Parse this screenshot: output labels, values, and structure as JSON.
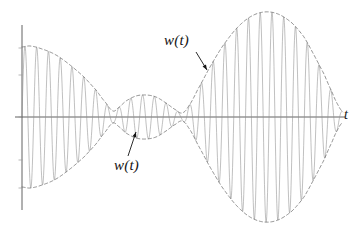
{
  "figure": {
    "title": "",
    "background_color": "#ffffff",
    "width": 358,
    "height": 236
  },
  "axes": {
    "t_axis": {
      "label": "t",
      "color": "#3a3a3a",
      "x_start": 15,
      "x_end": 345,
      "y": 117
    },
    "v_axis": {
      "label": "",
      "color": "#3a3a3a",
      "x": 22,
      "y_top": 25,
      "y_bottom": 210,
      "ticks": [
        48,
        75,
        117,
        160,
        188
      ]
    }
  },
  "annotations": [
    {
      "name": "envelope-label-upper",
      "text": "w(t)",
      "x": 164,
      "y": 33,
      "arrow": {
        "from_x": 196,
        "from_y": 52,
        "to_x": 207,
        "to_y": 70
      }
    },
    {
      "name": "envelope-label-lower",
      "text": "w(t)",
      "x": 114,
      "y": 158,
      "arrow": {
        "from_x": 128,
        "from_y": 156,
        "to_x": 136,
        "to_y": 132
      }
    }
  ],
  "chart_data": {
    "type": "line",
    "title": "",
    "xlabel": "t",
    "ylabel": "",
    "grid": false,
    "legend": null,
    "series": [
      {
        "name": "modulated-carrier",
        "style": "solid",
        "color": "#8c8c8c",
        "line_width": 0.55,
        "carrier_cycles_per_px": 0.085
      },
      {
        "name": "envelope-upper",
        "style": "dashed",
        "color": "#707070",
        "line_width": 0.7
      },
      {
        "name": "envelope-lower",
        "style": "dashed",
        "color": "#707070",
        "line_width": 0.7
      }
    ],
    "xlim": [
      22,
      345
    ],
    "ylim": [
      -110,
      110
    ],
    "baseline_y": 117,
    "envelope_control_points": [
      {
        "x": 22,
        "amp": 70
      },
      {
        "x": 30,
        "amp": 71
      },
      {
        "x": 42,
        "amp": 68
      },
      {
        "x": 56,
        "amp": 62
      },
      {
        "x": 70,
        "amp": 52
      },
      {
        "x": 84,
        "amp": 40
      },
      {
        "x": 96,
        "amp": 27
      },
      {
        "x": 106,
        "amp": 14
      },
      {
        "x": 113,
        "amp": 6
      },
      {
        "x": 118,
        "amp": 9
      },
      {
        "x": 126,
        "amp": 16
      },
      {
        "x": 136,
        "amp": 21
      },
      {
        "x": 146,
        "amp": 22
      },
      {
        "x": 156,
        "amp": 20
      },
      {
        "x": 166,
        "amp": 14
      },
      {
        "x": 176,
        "amp": 7
      },
      {
        "x": 182,
        "amp": 4
      },
      {
        "x": 188,
        "amp": 10
      },
      {
        "x": 198,
        "amp": 28
      },
      {
        "x": 210,
        "amp": 50
      },
      {
        "x": 222,
        "amp": 70
      },
      {
        "x": 236,
        "amp": 88
      },
      {
        "x": 250,
        "amp": 100
      },
      {
        "x": 264,
        "amp": 105
      },
      {
        "x": 278,
        "amp": 103
      },
      {
        "x": 292,
        "amp": 94
      },
      {
        "x": 304,
        "amp": 80
      },
      {
        "x": 314,
        "amp": 62
      },
      {
        "x": 324,
        "amp": 43
      },
      {
        "x": 332,
        "amp": 25
      },
      {
        "x": 338,
        "amp": 12
      },
      {
        "x": 343,
        "amp": 5
      }
    ]
  }
}
